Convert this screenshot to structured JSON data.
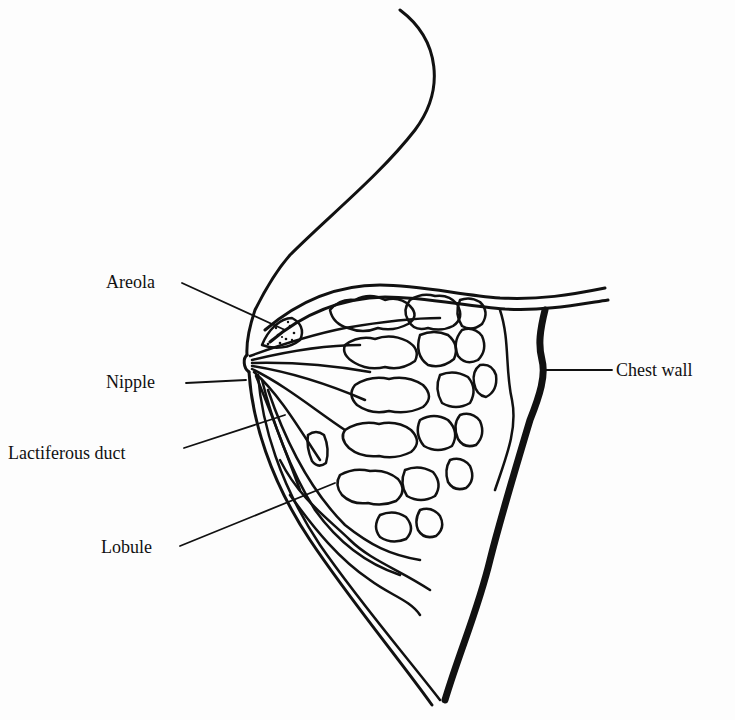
{
  "figure": {
    "type": "anatomical-line-drawing",
    "labels": {
      "areola": "Areola",
      "nipple": "Nipple",
      "lactiferous_duct": "Lactiferous duct",
      "lobule": "Lobule",
      "chest_wall": "Chest wall"
    }
  },
  "colors": {
    "background": "#fdfdfd",
    "ink": "#111111",
    "bleed_through": "#ececec"
  }
}
